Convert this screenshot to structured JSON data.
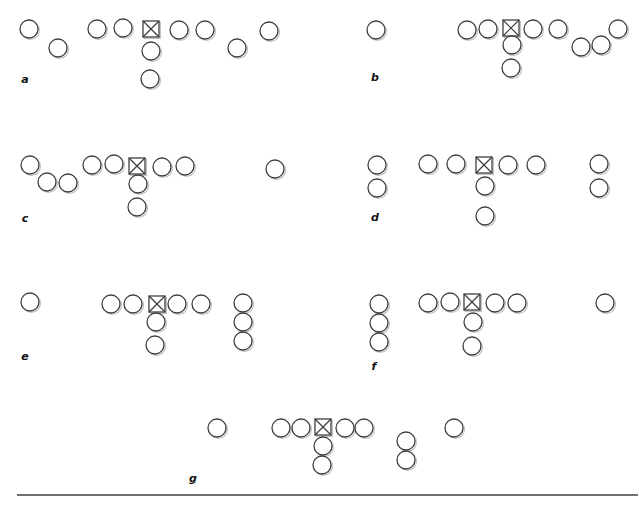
{
  "figure": {
    "kind": "spatial-arrangement-diagram",
    "style": {
      "background": "#ffffff",
      "stroke": "#3f3f3f",
      "fill": "#ffffff",
      "shadow": "#c3c3c3",
      "label_color": "#101010",
      "label_font_size": 11,
      "stroke_width": 1.3,
      "shadow_offset": 1.4
    },
    "geometry": {
      "circle_diameter": 18,
      "square_size": 16
    },
    "bottom_rule": {
      "x1": 17,
      "x2": 638,
      "y": 495,
      "thickness": 1.4,
      "color": "#3f3f3f"
    },
    "panels": [
      {
        "id": "a",
        "label": "a",
        "label_pos": {
          "x": 25,
          "y": 80
        },
        "items": [
          {
            "type": "circle",
            "x": 29,
            "y": 29
          },
          {
            "type": "circle",
            "x": 58,
            "y": 48
          },
          {
            "type": "circle",
            "x": 97,
            "y": 29
          },
          {
            "type": "circle",
            "x": 123,
            "y": 28
          },
          {
            "type": "crossed-square",
            "x": 151,
            "y": 29
          },
          {
            "type": "circle",
            "x": 179,
            "y": 30
          },
          {
            "type": "circle",
            "x": 205,
            "y": 30
          },
          {
            "type": "circle",
            "x": 237,
            "y": 48
          },
          {
            "type": "circle",
            "x": 269,
            "y": 31
          },
          {
            "type": "circle",
            "x": 151,
            "y": 51
          },
          {
            "type": "circle",
            "x": 150,
            "y": 79
          }
        ]
      },
      {
        "id": "b",
        "label": "b",
        "label_pos": {
          "x": 375,
          "y": 78
        },
        "items": [
          {
            "type": "circle",
            "x": 376,
            "y": 30
          },
          {
            "type": "circle",
            "x": 467,
            "y": 30
          },
          {
            "type": "circle",
            "x": 488,
            "y": 29
          },
          {
            "type": "crossed-square",
            "x": 511,
            "y": 28
          },
          {
            "type": "circle",
            "x": 533,
            "y": 29
          },
          {
            "type": "circle",
            "x": 558,
            "y": 29
          },
          {
            "type": "circle",
            "x": 581,
            "y": 47
          },
          {
            "type": "circle",
            "x": 601,
            "y": 45
          },
          {
            "type": "circle",
            "x": 618,
            "y": 29
          },
          {
            "type": "circle",
            "x": 512,
            "y": 45
          },
          {
            "type": "circle",
            "x": 511,
            "y": 68
          }
        ]
      },
      {
        "id": "c",
        "label": "c",
        "label_pos": {
          "x": 25,
          "y": 219
        },
        "items": [
          {
            "type": "circle",
            "x": 30,
            "y": 165
          },
          {
            "type": "circle",
            "x": 47,
            "y": 182
          },
          {
            "type": "circle",
            "x": 68,
            "y": 183
          },
          {
            "type": "circle",
            "x": 92,
            "y": 165
          },
          {
            "type": "circle",
            "x": 114,
            "y": 164
          },
          {
            "type": "crossed-square",
            "x": 137,
            "y": 166
          },
          {
            "type": "circle",
            "x": 162,
            "y": 167
          },
          {
            "type": "circle",
            "x": 185,
            "y": 166
          },
          {
            "type": "circle",
            "x": 275,
            "y": 169
          },
          {
            "type": "circle",
            "x": 138,
            "y": 184
          },
          {
            "type": "circle",
            "x": 137,
            "y": 207
          }
        ]
      },
      {
        "id": "d",
        "label": "d",
        "label_pos": {
          "x": 375,
          "y": 218
        },
        "items": [
          {
            "type": "circle",
            "x": 377,
            "y": 165
          },
          {
            "type": "circle",
            "x": 377,
            "y": 188
          },
          {
            "type": "circle",
            "x": 428,
            "y": 164
          },
          {
            "type": "circle",
            "x": 456,
            "y": 164
          },
          {
            "type": "crossed-square",
            "x": 484,
            "y": 165
          },
          {
            "type": "circle",
            "x": 508,
            "y": 165
          },
          {
            "type": "circle",
            "x": 536,
            "y": 165
          },
          {
            "type": "circle",
            "x": 599,
            "y": 164
          },
          {
            "type": "circle",
            "x": 599,
            "y": 188
          },
          {
            "type": "circle",
            "x": 485,
            "y": 186
          },
          {
            "type": "circle",
            "x": 485,
            "y": 216
          }
        ]
      },
      {
        "id": "e",
        "label": "e",
        "label_pos": {
          "x": 25,
          "y": 357
        },
        "items": [
          {
            "type": "circle",
            "x": 30,
            "y": 302
          },
          {
            "type": "circle",
            "x": 111,
            "y": 304
          },
          {
            "type": "circle",
            "x": 133,
            "y": 304
          },
          {
            "type": "crossed-square",
            "x": 157,
            "y": 304
          },
          {
            "type": "circle",
            "x": 177,
            "y": 304
          },
          {
            "type": "circle",
            "x": 201,
            "y": 304
          },
          {
            "type": "circle",
            "x": 243,
            "y": 303
          },
          {
            "type": "circle",
            "x": 243,
            "y": 322
          },
          {
            "type": "circle",
            "x": 243,
            "y": 341
          },
          {
            "type": "circle",
            "x": 156,
            "y": 322
          },
          {
            "type": "circle",
            "x": 155,
            "y": 345
          }
        ]
      },
      {
        "id": "f",
        "label": "f",
        "label_pos": {
          "x": 374,
          "y": 367
        },
        "items": [
          {
            "type": "circle",
            "x": 379,
            "y": 304
          },
          {
            "type": "circle",
            "x": 379,
            "y": 323
          },
          {
            "type": "circle",
            "x": 379,
            "y": 342
          },
          {
            "type": "circle",
            "x": 428,
            "y": 303
          },
          {
            "type": "circle",
            "x": 450,
            "y": 302
          },
          {
            "type": "crossed-square",
            "x": 472,
            "y": 302
          },
          {
            "type": "circle",
            "x": 495,
            "y": 303
          },
          {
            "type": "circle",
            "x": 517,
            "y": 303
          },
          {
            "type": "circle",
            "x": 605,
            "y": 303
          },
          {
            "type": "circle",
            "x": 473,
            "y": 322
          },
          {
            "type": "circle",
            "x": 472,
            "y": 346
          }
        ]
      },
      {
        "id": "g",
        "label": "g",
        "label_pos": {
          "x": 193,
          "y": 479
        },
        "items": [
          {
            "type": "circle",
            "x": 217,
            "y": 428
          },
          {
            "type": "circle",
            "x": 281,
            "y": 428
          },
          {
            "type": "circle",
            "x": 301,
            "y": 428
          },
          {
            "type": "crossed-square",
            "x": 323,
            "y": 427
          },
          {
            "type": "circle",
            "x": 345,
            "y": 428
          },
          {
            "type": "circle",
            "x": 364,
            "y": 428
          },
          {
            "type": "circle",
            "x": 406,
            "y": 441
          },
          {
            "type": "circle",
            "x": 406,
            "y": 460
          },
          {
            "type": "circle",
            "x": 454,
            "y": 428
          },
          {
            "type": "circle",
            "x": 323,
            "y": 446
          },
          {
            "type": "circle",
            "x": 322,
            "y": 465
          }
        ]
      }
    ]
  }
}
